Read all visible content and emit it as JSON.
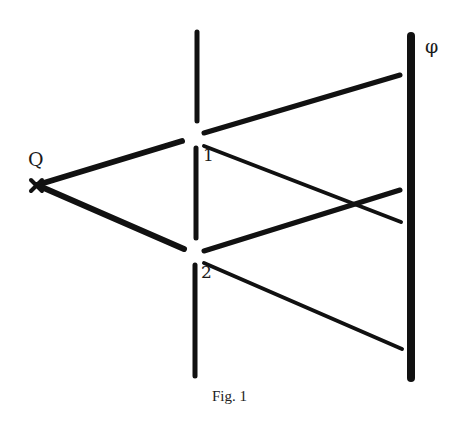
{
  "figure": {
    "caption": "Fig. 1",
    "labels": {
      "source": "Q",
      "screen": "φ",
      "slit1": "1",
      "slit2": "2"
    },
    "colors": {
      "ink": "#111111",
      "background": "#ffffff"
    }
  }
}
